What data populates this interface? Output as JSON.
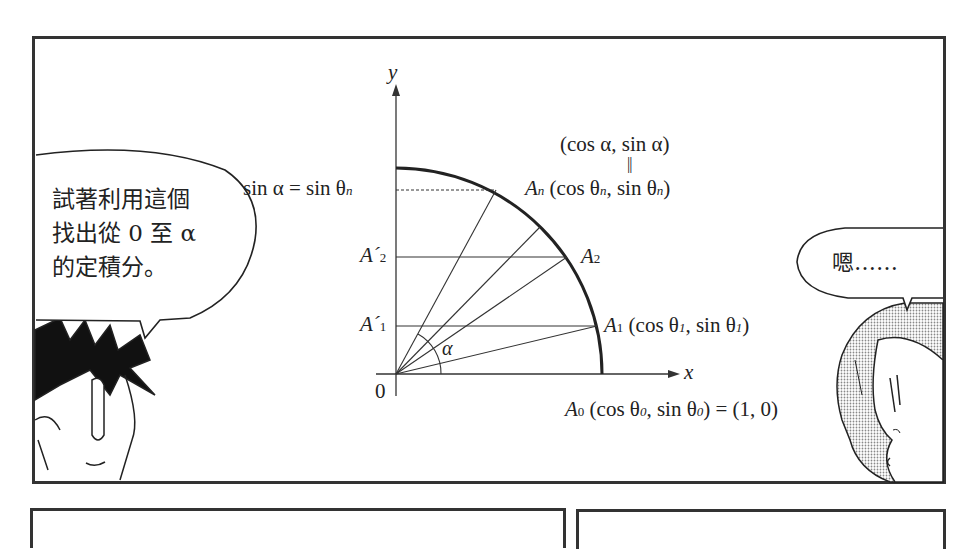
{
  "left_bubble": {
    "lines": [
      "試著利用這個",
      "找出從 0 至 α",
      "的定積分。"
    ]
  },
  "right_bubble": {
    "text": "嗯……"
  },
  "diagram": {
    "axis_y_label": "y",
    "axis_x_label": "x",
    "origin_label": "0",
    "alpha_label": "α",
    "top_point_label": "(cos α, sin α)",
    "equals_mark": "||",
    "sin_label": "sin α = sin θ",
    "sin_label_sub": "n",
    "An": {
      "name": "A",
      "sub": "n",
      "coords_a": "(cos θ",
      "sub_a": "n",
      "coords_b": ", sin θ",
      "sub_b": "n",
      "close": ")"
    },
    "A2": {
      "name": "A",
      "sub": "2"
    },
    "A1": {
      "name": "A",
      "sub": "1",
      "coords_a": "(cos θ",
      "sub_a": "1",
      "coords_b": ", sin θ",
      "sub_b": "1",
      "close": ")"
    },
    "A0": {
      "name": "A",
      "sub": "0",
      "coords_a": "(cos θ",
      "sub_a": "0",
      "coords_b": ", sin θ",
      "sub_b": "0",
      "close": ")",
      "equals": " = (1, 0)"
    },
    "A2_prime": {
      "name": "A´",
      "sub": "2"
    },
    "A1_prime": {
      "name": "A´",
      "sub": "1"
    }
  },
  "colors": {
    "ink": "#222222",
    "border": "#333333",
    "screentone": "#bdbdbd"
  }
}
